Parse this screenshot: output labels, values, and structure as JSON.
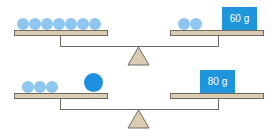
{
  "colors": {
    "small_ball": "#8ec6ef",
    "big_ball": "#1e90e0",
    "weight_box": "#1f95dc",
    "plate_fill": "#d9ccb0",
    "outline": "#6e6a62",
    "fulcrum_fill": "#d9ccb0"
  },
  "scales": [
    {
      "left_pan": {
        "small_balls": 7,
        "big_balls": 0
      },
      "right_pan": {
        "small_balls": 2,
        "weight_label": "60 g"
      }
    },
    {
      "left_pan": {
        "small_balls": 3,
        "big_balls": 1
      },
      "right_pan": {
        "small_balls": 0,
        "weight_label": "80 g"
      }
    }
  ]
}
